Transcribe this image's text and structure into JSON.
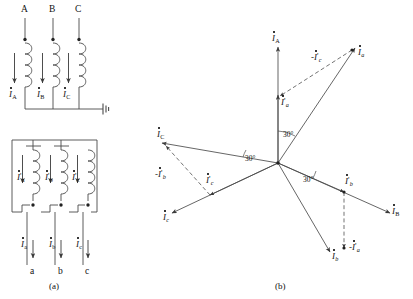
{
  "figure": {
    "caption_a": "(a)",
    "caption_b": "(b)",
    "line_color": "#4a4a4a",
    "text_color": "#111111",
    "dash_color": "#5a5a5a"
  },
  "circuit": {
    "primary": {
      "terminals": [
        {
          "name": "A"
        },
        {
          "name": "B"
        },
        {
          "name": "C"
        }
      ],
      "currents": [
        {
          "symbol": "I",
          "sub": "A",
          "prime": ""
        },
        {
          "symbol": "I",
          "sub": "B",
          "prime": ""
        },
        {
          "symbol": "I",
          "sub": "C",
          "prime": ""
        }
      ],
      "neutral_icon": "ground-icon"
    },
    "secondary": {
      "terminals": [
        {
          "name": "a"
        },
        {
          "name": "b"
        },
        {
          "name": "c"
        }
      ],
      "winding_currents": [
        {
          "symbol": "I",
          "sub": "a",
          "prime": "'"
        },
        {
          "symbol": "I",
          "sub": "b",
          "prime": "'"
        },
        {
          "symbol": "I",
          "sub": "c",
          "prime": "'"
        }
      ],
      "line_currents": [
        {
          "symbol": "I",
          "sub": "a",
          "prime": ""
        },
        {
          "symbol": "I",
          "sub": "b",
          "prime": ""
        },
        {
          "symbol": "I",
          "sub": "c",
          "prime": ""
        }
      ]
    }
  },
  "phasor": {
    "angle_labels": [
      "30°",
      "30°",
      "30°"
    ],
    "vectors": [
      {
        "id": "IA",
        "label_symbol": "I",
        "label_sub": "A",
        "label_prime": "",
        "label_neg": "",
        "style": "solid"
      },
      {
        "id": "Ia",
        "label_symbol": "I",
        "label_sub": "a",
        "label_prime": "",
        "label_neg": "",
        "style": "solid"
      },
      {
        "id": "IpaA",
        "label_symbol": "I",
        "label_sub": "a",
        "label_prime": "'",
        "label_neg": "",
        "style": "solid"
      },
      {
        "id": "negIpc",
        "label_symbol": "I",
        "label_sub": "c",
        "label_prime": "'",
        "label_neg": "-",
        "style": "dashed"
      },
      {
        "id": "IC",
        "label_symbol": "I",
        "label_sub": "C",
        "label_prime": "",
        "label_neg": "",
        "style": "solid"
      },
      {
        "id": "negIpb",
        "label_symbol": "I",
        "label_sub": "b",
        "label_prime": "'",
        "label_neg": "-",
        "style": "dashed"
      },
      {
        "id": "Ipc",
        "label_symbol": "I",
        "label_sub": "c",
        "label_prime": "'",
        "label_neg": "",
        "style": "dashed"
      },
      {
        "id": "Ic",
        "label_symbol": "I",
        "label_sub": "c",
        "label_prime": "",
        "label_neg": "",
        "style": "solid"
      },
      {
        "id": "Ipb",
        "label_symbol": "I",
        "label_sub": "b",
        "label_prime": "'",
        "label_neg": "",
        "style": "solid"
      },
      {
        "id": "IB",
        "label_symbol": "I",
        "label_sub": "B",
        "label_prime": "",
        "label_neg": "",
        "style": "solid"
      },
      {
        "id": "Ib",
        "label_symbol": "I",
        "label_sub": "b",
        "label_prime": "",
        "label_neg": "",
        "style": "solid"
      },
      {
        "id": "negIpa",
        "label_symbol": "I",
        "label_sub": "a",
        "label_prime": "'",
        "label_neg": "-",
        "style": "dashed"
      }
    ]
  }
}
